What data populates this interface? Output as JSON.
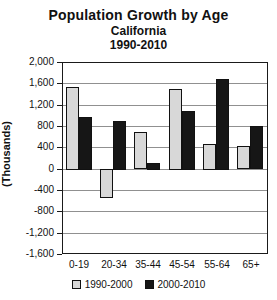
{
  "chart_data": {
    "type": "bar",
    "title": "Population Growth by Age",
    "subtitle_region": "California",
    "subtitle_period": "1990-2010",
    "ylabel": "(Thousands)",
    "xlabel": "",
    "categories": [
      "0-19",
      "20-34",
      "35-44",
      "45-54",
      "55-64",
      "65+"
    ],
    "series": [
      {
        "name": "1990-2000",
        "color": "#d8d8d8",
        "values": [
          1550,
          -550,
          700,
          1520,
          490,
          440
        ]
      },
      {
        "name": "2000-2010",
        "color": "#161616",
        "values": [
          990,
          920,
          130,
          1100,
          1700,
          810
        ]
      }
    ],
    "ylim": [
      -1600,
      2000
    ],
    "ytick_step": 400,
    "ytick_labels": [
      "2,000",
      "1,600",
      "1,200",
      "800",
      "400",
      "0",
      "-400",
      "-800",
      "-1,200",
      "-1,600"
    ],
    "grid": true,
    "legend_position": "bottom",
    "gridline_color": "#909090",
    "axis_color": "#1a1a1a"
  }
}
